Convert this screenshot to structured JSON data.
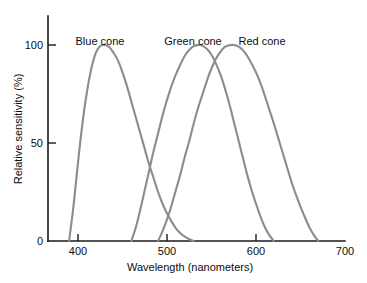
{
  "chart_data": {
    "type": "line",
    "title": "",
    "xlabel": "Wavelength (nanometers)",
    "ylabel": "Relative sensitivity (%)",
    "xlim": [
      380,
      700
    ],
    "ylim": [
      0,
      110
    ],
    "xticks": [
      400,
      500,
      600,
      700
    ],
    "xtick_labels": [
      "400",
      "500",
      "600",
      "700"
    ],
    "yticks": [
      0,
      50,
      100
    ],
    "ytick_labels": [
      "0",
      "50",
      "100"
    ],
    "grid": false,
    "legend_position": "inline-labels",
    "series": [
      {
        "name": "Blue cone",
        "label": "Blue cone",
        "color": "#8c8c8c",
        "peak_x": 430,
        "peak_y": 100,
        "x": [
          390,
          395,
          400,
          405,
          410,
          415,
          420,
          425,
          430,
          435,
          440,
          445,
          450,
          455,
          460,
          465,
          470,
          475,
          480,
          485,
          490,
          495,
          500,
          505,
          510,
          515,
          520,
          525,
          530
        ],
        "y": [
          0,
          18,
          40,
          60,
          76,
          88,
          96,
          99.5,
          100,
          99,
          96,
          92,
          86,
          79,
          71,
          63,
          55,
          47,
          39,
          32,
          25,
          19,
          14,
          10,
          6.5,
          4,
          2.2,
          0.9,
          0
        ]
      },
      {
        "name": "Green cone",
        "label": "Green cone",
        "color": "#8c8c8c",
        "peak_x": 537,
        "peak_y": 100,
        "x": [
          460,
          465,
          470,
          475,
          480,
          485,
          490,
          495,
          500,
          505,
          510,
          515,
          520,
          525,
          530,
          535,
          537,
          540,
          545,
          550,
          555,
          560,
          565,
          570,
          575,
          580,
          585,
          590,
          595,
          600,
          605,
          610,
          615,
          620
        ],
        "y": [
          0,
          7,
          16,
          26,
          36,
          46,
          55,
          64,
          72,
          79,
          85,
          90,
          94.5,
          97.5,
          99.4,
          100,
          100,
          99.6,
          98,
          95,
          90.5,
          85,
          78,
          70,
          61,
          52,
          43,
          34,
          26,
          19,
          12.5,
          7,
          3,
          0
        ]
      },
      {
        "name": "Red cone",
        "label": "Red cone",
        "color": "#8c8c8c",
        "peak_x": 575,
        "peak_y": 100,
        "x": [
          490,
          495,
          500,
          505,
          510,
          515,
          520,
          525,
          530,
          535,
          540,
          545,
          550,
          555,
          560,
          565,
          570,
          575,
          580,
          585,
          590,
          595,
          600,
          605,
          610,
          615,
          620,
          625,
          630,
          635,
          640,
          645,
          650,
          655,
          660,
          665,
          670
        ],
        "y": [
          0,
          5,
          11,
          18,
          26,
          34,
          43,
          51,
          60,
          68,
          75,
          82,
          88,
          93,
          96.5,
          99,
          99.9,
          100,
          99.3,
          97.5,
          94.5,
          90.5,
          86,
          80.5,
          74,
          67,
          60,
          52.5,
          45,
          37.5,
          30,
          23.5,
          17.5,
          12,
          7,
          3,
          0
        ]
      }
    ]
  },
  "labels": {
    "blue_cone": "Blue cone",
    "green_cone": "Green cone",
    "red_cone": "Red cone",
    "x_axis_title": "Wavelength (nanometers)",
    "y_axis_title": "Relative sensitivity (%)",
    "y_100": "100",
    "y_50": "50",
    "y_0": "0",
    "x_400": "400",
    "x_500": "500",
    "x_600": "600",
    "x_700": "700"
  },
  "colors": {
    "curve_stroke": "#8c8c8c",
    "axis": "#1a1a1a",
    "background": "#ffffff"
  }
}
